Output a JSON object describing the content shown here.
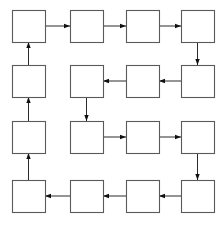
{
  "diagram": {
    "type": "grid-flow-diagram",
    "title": "",
    "background_color": "#ffffff",
    "box_stroke_color": "#5a5a5a",
    "box_fill_color": "#ffffff",
    "edge_color": "#2b2b2b",
    "arrowhead_color": "#101010",
    "canvas": {
      "width": 224,
      "height": 225
    },
    "grid": {
      "rows": 4,
      "cols": 4,
      "box_width": 33,
      "box_height": 32,
      "col_x": [
        12,
        70,
        126,
        181
      ],
      "row_y": [
        10,
        65,
        121,
        180
      ]
    },
    "nodes": [
      {
        "id": "r1c1",
        "row": 0,
        "col": 0,
        "label": ""
      },
      {
        "id": "r1c2",
        "row": 0,
        "col": 1,
        "label": ""
      },
      {
        "id": "r1c3",
        "row": 0,
        "col": 2,
        "label": ""
      },
      {
        "id": "r1c4",
        "row": 0,
        "col": 3,
        "label": ""
      },
      {
        "id": "r2c1",
        "row": 1,
        "col": 0,
        "label": ""
      },
      {
        "id": "r2c2",
        "row": 1,
        "col": 1,
        "label": ""
      },
      {
        "id": "r2c3",
        "row": 1,
        "col": 2,
        "label": ""
      },
      {
        "id": "r2c4",
        "row": 1,
        "col": 3,
        "label": ""
      },
      {
        "id": "r3c1",
        "row": 2,
        "col": 0,
        "label": ""
      },
      {
        "id": "r3c2",
        "row": 2,
        "col": 1,
        "label": ""
      },
      {
        "id": "r3c3",
        "row": 2,
        "col": 2,
        "label": ""
      },
      {
        "id": "r3c4",
        "row": 2,
        "col": 3,
        "label": ""
      },
      {
        "id": "r4c1",
        "row": 3,
        "col": 0,
        "label": ""
      },
      {
        "id": "r4c2",
        "row": 3,
        "col": 1,
        "label": ""
      },
      {
        "id": "r4c3",
        "row": 3,
        "col": 2,
        "label": ""
      },
      {
        "id": "r4c4",
        "row": 3,
        "col": 3,
        "label": ""
      }
    ],
    "edges": [
      {
        "from": "r1c1",
        "to": "r1c2",
        "direction": "right"
      },
      {
        "from": "r1c2",
        "to": "r1c3",
        "direction": "right"
      },
      {
        "from": "r1c3",
        "to": "r1c4",
        "direction": "right"
      },
      {
        "from": "r1c4",
        "to": "r2c4",
        "direction": "down"
      },
      {
        "from": "r2c4",
        "to": "r2c3",
        "direction": "left"
      },
      {
        "from": "r2c3",
        "to": "r2c2",
        "direction": "left"
      },
      {
        "from": "r2c2",
        "to": "r3c2",
        "direction": "down"
      },
      {
        "from": "r3c2",
        "to": "r3c3",
        "direction": "right"
      },
      {
        "from": "r3c3",
        "to": "r3c4",
        "direction": "right"
      },
      {
        "from": "r3c4",
        "to": "r4c4",
        "direction": "down"
      },
      {
        "from": "r4c4",
        "to": "r4c3",
        "direction": "left"
      },
      {
        "from": "r4c3",
        "to": "r4c2",
        "direction": "left"
      },
      {
        "from": "r4c2",
        "to": "r4c1",
        "direction": "left"
      },
      {
        "from": "r4c1",
        "to": "r3c1",
        "direction": "up"
      },
      {
        "from": "r3c1",
        "to": "r2c1",
        "direction": "up"
      },
      {
        "from": "r2c1",
        "to": "r1c1",
        "direction": "up"
      }
    ]
  }
}
